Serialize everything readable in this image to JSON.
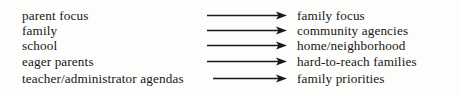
{
  "diagram": {
    "type": "mapping-diagram",
    "orientation": "left-to-right",
    "arrow_glyph": "rightwards-arrow",
    "colors": {
      "background": "#fdfdfc",
      "text": "#161616",
      "arrow": "#1a1a1a"
    },
    "rows": [
      {
        "source": "parent focus",
        "target": "family focus",
        "arrow_start_x": 207,
        "arrow_end_x": 287,
        "y": 8
      },
      {
        "source": "family",
        "target": "community agencies",
        "arrow_start_x": 207,
        "arrow_end_x": 287,
        "y": 23
      },
      {
        "source": "school",
        "target": "home/neighborhood",
        "arrow_start_x": 207,
        "arrow_end_x": 287,
        "y": 38
      },
      {
        "source": "eager parents",
        "target": "hard-to-reach families",
        "arrow_start_x": 207,
        "arrow_end_x": 287,
        "y": 54
      },
      {
        "source": "teacher/administrator agendas",
        "target": "family priorities",
        "arrow_start_x": 213,
        "arrow_end_x": 287,
        "y": 71
      }
    ]
  }
}
